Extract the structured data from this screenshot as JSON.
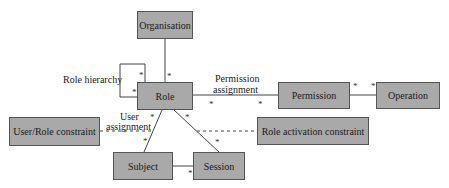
{
  "entities": {
    "organisation": "Organisation",
    "role": "Role",
    "permission": "Permission",
    "operation": "Operation",
    "user_role_constraint": "User/Role constraint",
    "role_activation_constraint": "Role activation constraint",
    "subject": "Subject",
    "session": "Session"
  },
  "relations": {
    "role_hierarchy": "Role hierarchy",
    "permission_assignment_1": "Permission",
    "permission_assignment_2": "assignment",
    "user_assignment_1": "User",
    "user_assignment_2": "assignment"
  },
  "multiplicity": "*",
  "colors": {
    "box_fill": "#a9a9a9",
    "line": "#444444"
  }
}
